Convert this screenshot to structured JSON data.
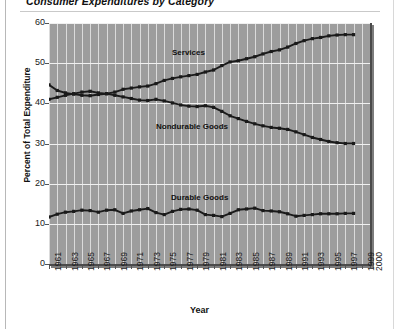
{
  "figure": {
    "title": "Consumer Expenditures by Category",
    "axis_title_x": "Year",
    "axis_title_y": "Percent of Total Expenditure"
  },
  "annotations": {
    "services": "Services",
    "nondurable": "Nondurable Goods",
    "durable": "Durable Goods"
  },
  "colors": {
    "plot_background": "#9d9d9d",
    "gridline": "#e6e6e6",
    "line": "#1a1a1a",
    "page_background": "#ffffff",
    "text": "#1a1a1a"
  },
  "chart_data": {
    "type": "line",
    "title": "Consumer Expenditures by Category",
    "xlabel": "Year",
    "ylabel": "Percent of Total Expenditure",
    "ylim": [
      0,
      60
    ],
    "yticks": [
      0,
      10,
      20,
      30,
      40,
      50,
      60
    ],
    "xlim": [
      1961,
      2000
    ],
    "xticks": [
      1961,
      1963,
      1965,
      1967,
      1969,
      1971,
      1973,
      1975,
      1977,
      1979,
      1981,
      1983,
      1985,
      1987,
      1989,
      1991,
      1993,
      1995,
      1997,
      1999,
      2000
    ],
    "grid": true,
    "legend": "inline-annotations",
    "markers": "square",
    "x": [
      1961,
      1962,
      1963,
      1964,
      1965,
      1966,
      1967,
      1968,
      1969,
      1970,
      1971,
      1972,
      1973,
      1974,
      1975,
      1976,
      1977,
      1978,
      1979,
      1980,
      1981,
      1982,
      1983,
      1984,
      1985,
      1986,
      1987,
      1988,
      1989,
      1990,
      1991,
      1992,
      1993,
      1994,
      1995,
      1996,
      1997,
      1998
    ],
    "series": [
      {
        "name": "Services",
        "values": [
          44.6,
          43.2,
          42.6,
          42.3,
          42.0,
          41.9,
          42.2,
          42.4,
          42.8,
          43.5,
          43.8,
          44.1,
          44.3,
          44.9,
          45.7,
          46.2,
          46.6,
          46.9,
          47.2,
          47.8,
          48.3,
          49.4,
          50.3,
          50.6,
          51.1,
          51.6,
          52.3,
          52.9,
          53.3,
          54.0,
          54.9,
          55.6,
          56.1,
          56.4,
          56.8,
          57.0,
          57.1,
          57.1
        ]
      },
      {
        "name": "Nondurable Goods",
        "values": [
          41.0,
          41.5,
          42.0,
          42.4,
          42.8,
          43.0,
          42.6,
          42.4,
          42.0,
          41.6,
          41.2,
          40.8,
          40.7,
          41.0,
          40.6,
          40.1,
          39.6,
          39.3,
          39.2,
          39.4,
          39.0,
          38.0,
          36.9,
          36.2,
          35.5,
          34.9,
          34.4,
          34.0,
          33.8,
          33.5,
          32.9,
          32.2,
          31.5,
          31.0,
          30.5,
          30.2,
          30.0,
          30.0
        ]
      },
      {
        "name": "Durable Goods",
        "values": [
          11.7,
          12.4,
          12.9,
          13.1,
          13.4,
          13.3,
          12.9,
          13.4,
          13.5,
          12.6,
          13.2,
          13.5,
          13.8,
          12.8,
          12.3,
          13.1,
          13.6,
          13.7,
          13.4,
          12.3,
          12.1,
          11.8,
          12.6,
          13.5,
          13.7,
          13.9,
          13.3,
          13.2,
          13.0,
          12.5,
          11.9,
          12.1,
          12.3,
          12.5,
          12.5,
          12.5,
          12.6,
          12.6
        ]
      }
    ]
  }
}
